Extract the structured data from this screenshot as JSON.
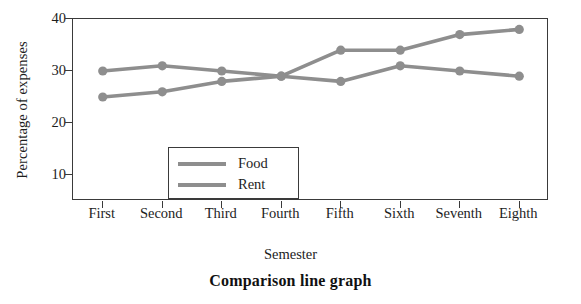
{
  "chart_data": {
    "type": "line",
    "title": "Comparison line graph",
    "xlabel": "Semester",
    "ylabel": "Percentage of expenses",
    "categories": [
      "First",
      "Second",
      "Third",
      "Fourth",
      "Fifth",
      "Sixth",
      "Seventh",
      "Eighth"
    ],
    "series": [
      {
        "name": "Food",
        "values": [
          30,
          31,
          30,
          29,
          28,
          31,
          30,
          29
        ],
        "color": "#8e8e8e"
      },
      {
        "name": "Rent",
        "values": [
          25,
          26,
          28,
          29,
          34,
          34,
          37,
          38
        ],
        "color": "#8e8e8e"
      }
    ],
    "yticks": [
      10,
      20,
      30,
      40
    ],
    "ylim": [
      5,
      40
    ],
    "grid": false,
    "legend_position": "inside-lower-left",
    "marker": "circle"
  },
  "legend": {
    "items": [
      {
        "label": "Food"
      },
      {
        "label": "Rent"
      }
    ]
  }
}
